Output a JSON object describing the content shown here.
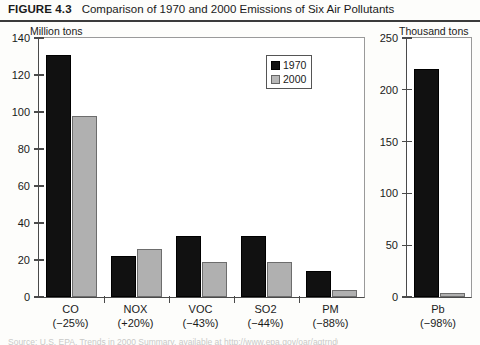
{
  "header": {
    "figure_number": "FIGURE 4.3",
    "title": "Comparison of 1970 and 2000 Emissions of Six Air Pollutants"
  },
  "legend": {
    "position": "inside-top-right",
    "items": [
      {
        "label": "1970",
        "color": "#111111"
      },
      {
        "label": "2000",
        "color": "#b0b0b0"
      }
    ]
  },
  "source_note": "Source: U.S. EPA, Trends in 2000 Summary, available at http://www.epa.gov/oar/aqtrnd00/",
  "chart_data": [
    {
      "id": "left-panel",
      "type": "bar",
      "title": "",
      "ylabel": "Million tons",
      "xlabel": "",
      "ylim": [
        0,
        140
      ],
      "yticks": [
        0,
        20,
        40,
        60,
        80,
        100,
        120,
        140
      ],
      "grid": false,
      "legend": [
        "1970",
        "2000"
      ],
      "categories": [
        "CO",
        "NOX",
        "VOC",
        "SO2",
        "PM"
      ],
      "category_annotations": [
        "(−25%)",
        "(+20%)",
        "(−43%)",
        "(−44%)",
        "(−88%)"
      ],
      "series": [
        {
          "name": "1970",
          "color": "#111111",
          "values": [
            131,
            22,
            33,
            33,
            14
          ]
        },
        {
          "name": "2000",
          "color": "#b0b0b0",
          "values": [
            98,
            26,
            19,
            19,
            4
          ]
        }
      ]
    },
    {
      "id": "right-panel",
      "type": "bar",
      "title": "",
      "ylabel": "Thousand tons",
      "xlabel": "",
      "ylim": [
        0,
        250
      ],
      "yticks": [
        0,
        50,
        100,
        150,
        200,
        250
      ],
      "grid": false,
      "legend": [
        "1970",
        "2000"
      ],
      "categories": [
        "Pb"
      ],
      "category_annotations": [
        "(−98%)"
      ],
      "series": [
        {
          "name": "1970",
          "color": "#111111",
          "values": [
            220
          ]
        },
        {
          "name": "2000",
          "color": "#b0b0b0",
          "values": [
            4
          ]
        }
      ]
    }
  ]
}
